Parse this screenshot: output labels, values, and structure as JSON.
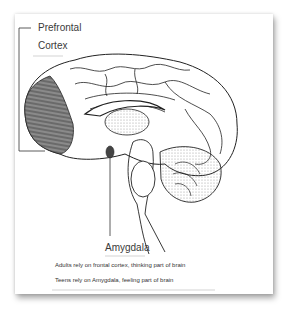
{
  "diagram": {
    "labels": {
      "prefrontal_line1": "Prefrontal",
      "prefrontal_line2": "Cortex",
      "amygdala": "Amygdala"
    },
    "captions": [
      "Adults rely on frontal cortex, thinking part of brain",
      "Teens rely on Amygdala, feeling part of brain"
    ],
    "colors": {
      "outline": "#222222",
      "prefrontal_shade": "#6e6e6e",
      "stipple": "#9a9a9a",
      "text": "#3a3a3a"
    }
  }
}
